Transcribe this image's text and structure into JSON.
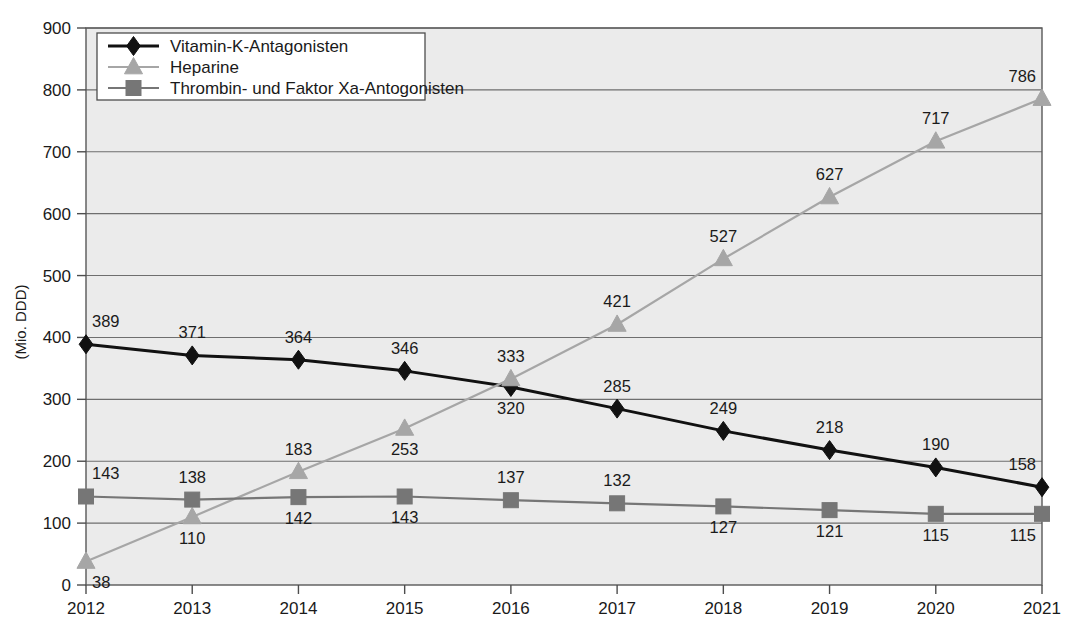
{
  "chart_data": {
    "type": "line",
    "title": "",
    "subtitle": "",
    "xlabel": "",
    "ylabel": "(Mio. DDD)",
    "categories": [
      "2012",
      "2013",
      "2014",
      "2015",
      "2016",
      "2017",
      "2018",
      "2019",
      "2020",
      "2021"
    ],
    "x": [
      2012,
      2013,
      2014,
      2015,
      2016,
      2017,
      2018,
      2019,
      2020,
      2021
    ],
    "ylim": [
      0,
      900
    ],
    "yticks": [
      0,
      100,
      200,
      300,
      400,
      500,
      600,
      700,
      800,
      900
    ],
    "ytick_labels": [
      "0",
      "100",
      "200",
      "300",
      "400",
      "500",
      "600",
      "700",
      "800",
      "900"
    ],
    "grid": true,
    "legend_position": "top-left",
    "series": [
      {
        "name": "Vitamin-K-Antagonisten",
        "color": "#111111",
        "marker": "diamond",
        "values": [
          389,
          371,
          364,
          346,
          320,
          285,
          249,
          218,
          190,
          158
        ],
        "labels": [
          "389",
          "371",
          "364",
          "346",
          "320",
          "285",
          "249",
          "218",
          "190",
          "158"
        ],
        "label_positions": [
          "above",
          "above",
          "above",
          "above",
          "below",
          "above",
          "above",
          "above",
          "above",
          "above"
        ]
      },
      {
        "name": "Heparine",
        "color": "#a6a6a6",
        "marker": "triangle",
        "values": [
          38,
          110,
          183,
          253,
          333,
          421,
          527,
          627,
          717,
          786
        ],
        "labels": [
          "38",
          "110",
          "183",
          "253",
          "333",
          "421",
          "527",
          "627",
          "717",
          "786"
        ],
        "label_positions": [
          "below",
          "below",
          "above",
          "below",
          "above",
          "above",
          "above",
          "above",
          "above",
          "above"
        ]
      },
      {
        "name": "Thrombin- und Faktor Xa-Antogonisten",
        "color": "#767676",
        "marker": "square",
        "values": [
          143,
          138,
          142,
          143,
          137,
          132,
          127,
          121,
          115,
          115
        ],
        "labels": [
          "143",
          "138",
          "142",
          "143",
          "137",
          "132",
          "127",
          "121",
          "115",
          "115"
        ],
        "label_positions": [
          "above",
          "above",
          "below",
          "below",
          "above",
          "above",
          "below",
          "below",
          "below",
          "below"
        ]
      }
    ]
  },
  "legend": {
    "items": [
      {
        "label": "Vitamin-K-Antagonisten"
      },
      {
        "label": "Heparine"
      },
      {
        "label": "Thrombin- und Faktor Xa-Antogonisten"
      }
    ]
  },
  "axes": {
    "y_title": "(Mio. DDD)",
    "y_tick_labels": [
      "900",
      "800",
      "700",
      "600",
      "500",
      "400",
      "300",
      "200",
      "100",
      "0"
    ],
    "x_tick_labels": [
      "2012",
      "2013",
      "2014",
      "2015",
      "2016",
      "2017",
      "2018",
      "2019",
      "2020",
      "2021"
    ]
  }
}
